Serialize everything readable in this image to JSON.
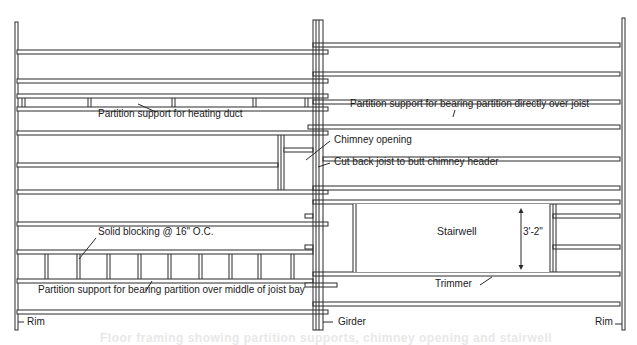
{
  "diagram": {
    "stroke_color": "#2a2a2a",
    "background": "#ffffff",
    "labels": [
      {
        "id": "heating-duct",
        "text": "Partition support for heating duct",
        "x": 98,
        "y": 117
      },
      {
        "id": "bearing-over-joist",
        "text": "Partition support for bearing partition directly over joist",
        "x": 350,
        "y": 107
      },
      {
        "id": "chimney-opening",
        "text": "Chimney opening",
        "x": 334,
        "y": 143
      },
      {
        "id": "cut-back-joist",
        "text": "Cut back joist to butt chimney header",
        "x": 334,
        "y": 165
      },
      {
        "id": "solid-blocking",
        "text": "Solid blocking @ 16\" O.C.",
        "x": 98,
        "y": 235
      },
      {
        "id": "stairwell",
        "text": "Stairwell",
        "x": 437,
        "y": 235
      },
      {
        "id": "stair-dimension",
        "text": "3'-2\"",
        "x": 523,
        "y": 235
      },
      {
        "id": "middle-of-bay",
        "text": "Partition support for bearing partition over middle of joist bay",
        "x": 38,
        "y": 293
      },
      {
        "id": "trimmer",
        "text": "Trimmer",
        "x": 435,
        "y": 287
      },
      {
        "id": "rim-left",
        "text": "Rim",
        "x": 27,
        "y": 325
      },
      {
        "id": "girder",
        "text": "Girder",
        "x": 338,
        "y": 325
      },
      {
        "id": "rim-right",
        "text": "Rim",
        "x": 595,
        "y": 325
      }
    ],
    "ghost_text": "Floor framing showing partition supports, chimney opening and stairwell",
    "components": {
      "left_rim": {
        "x": 15,
        "y1": 22,
        "y2": 330
      },
      "right_rim": {
        "x": 622,
        "y1": 18,
        "y2": 330
      },
      "girder": {
        "xs": [
          313,
          316,
          319,
          323
        ],
        "y1": 20,
        "y2": 330
      },
      "left_joists": [
        {
          "y": 50,
          "x1": 17,
          "x2": 328
        },
        {
          "y": 79,
          "x1": 17,
          "x2": 328
        },
        {
          "y": 94,
          "x1": 17,
          "x2": 328
        },
        {
          "y": 107,
          "x1": 17,
          "x2": 328
        },
        {
          "y": 131,
          "x1": 17,
          "x2": 328
        },
        {
          "y": 163,
          "x1": 17,
          "x2": 278
        },
        {
          "y": 190,
          "x1": 17,
          "x2": 328
        },
        {
          "y": 222,
          "x1": 17,
          "x2": 328
        },
        {
          "y": 250,
          "x1": 17,
          "x2": 313
        },
        {
          "y": 279,
          "x1": 17,
          "x2": 313
        },
        {
          "y": 310,
          "x1": 17,
          "x2": 328
        }
      ],
      "right_joists": [
        {
          "y": 43,
          "x1": 313,
          "x2": 620
        },
        {
          "y": 72,
          "x1": 313,
          "x2": 620
        },
        {
          "y": 100,
          "x1": 313,
          "x2": 620
        },
        {
          "y": 125,
          "x1": 308,
          "x2": 620
        },
        {
          "y": 157,
          "x1": 323,
          "x2": 620
        },
        {
          "y": 186,
          "x1": 313,
          "x2": 620
        },
        {
          "y": 200,
          "x1": 313,
          "x2": 620
        },
        {
          "y": 272,
          "x1": 313,
          "x2": 620
        },
        {
          "y": 302,
          "x1": 313,
          "x2": 620
        }
      ],
      "stair_side_joists": [
        {
          "y": 214,
          "x1": 553,
          "x2": 620
        },
        {
          "y": 245,
          "x1": 553,
          "x2": 620
        }
      ],
      "girder_side_blocks": [
        {
          "y": 214,
          "x1": 305,
          "x2": 313
        },
        {
          "y": 245,
          "x1": 305,
          "x2": 313
        },
        {
          "y": 283,
          "x1": 305,
          "x2": 337
        }
      ],
      "heating_duct_blocks": [
        22,
        88,
        172,
        253,
        305
      ],
      "solid_blocks": [
        45,
        77,
        107,
        138,
        168,
        199,
        229,
        258,
        291
      ],
      "chimney": {
        "x1": 278,
        "x2": 313,
        "y1": 135,
        "y2": 190,
        "inner_y": 152
      },
      "stairwell": {
        "x1": 353,
        "x2": 550,
        "y1": 204,
        "y2": 272,
        "dim_x": 521
      }
    }
  }
}
